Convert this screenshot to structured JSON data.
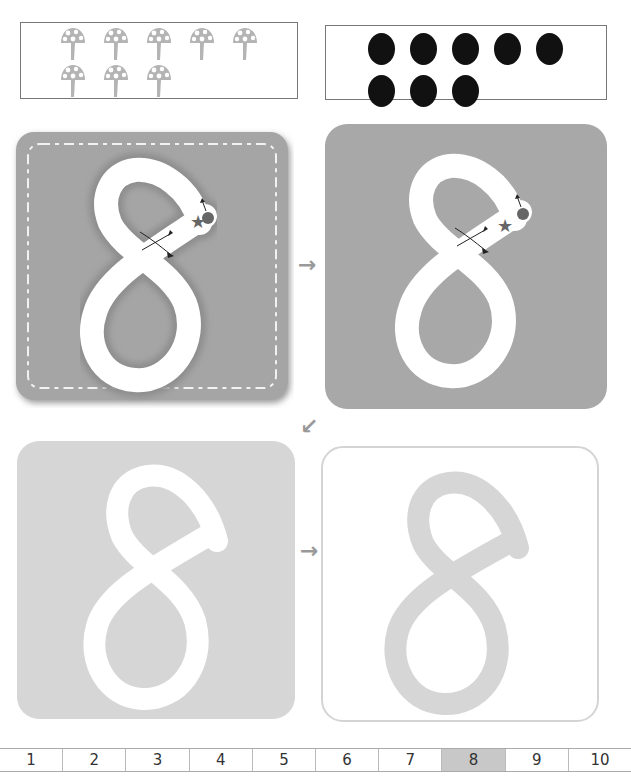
{
  "worksheet": {
    "digit": "8",
    "count_boxes": {
      "mushrooms": {
        "count": 8,
        "icon": "mushroom-icon",
        "row1": 5,
        "row2": 3,
        "color": "#b4b4b4"
      },
      "dots": {
        "count": 8,
        "icon": "dot-icon",
        "row1": 5,
        "row2": 3,
        "color": "#111111"
      }
    },
    "cards": [
      {
        "id": "trace-textured",
        "label": "8",
        "style": "textured-grooved",
        "bg": "#a5a5a5",
        "markers": [
          "start-dot",
          "star",
          "direction-arrows"
        ]
      },
      {
        "id": "trace-solid",
        "label": "8",
        "style": "solid-dark",
        "bg": "#a8a8a8",
        "markers": [
          "start-dot",
          "star",
          "direction-arrows"
        ]
      },
      {
        "id": "trace-light",
        "label": "8",
        "style": "light",
        "bg": "#d6d6d6"
      },
      {
        "id": "trace-outline",
        "label": "8",
        "style": "outline",
        "bg": "#ffffff",
        "stroke": "#d6d6d6"
      }
    ],
    "arrows": [
      "→",
      "↙",
      "→"
    ],
    "number_strip": {
      "cells": [
        "1",
        "2",
        "3",
        "4",
        "5",
        "6",
        "7",
        "8",
        "9",
        "10"
      ],
      "active": "8"
    }
  }
}
